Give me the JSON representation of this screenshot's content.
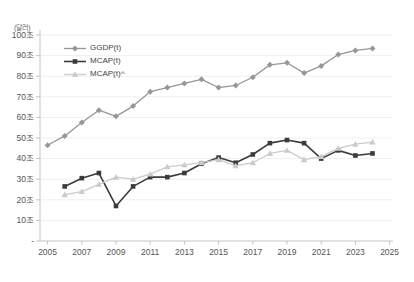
{
  "chart_data": {
    "type": "line",
    "title": "",
    "unit_label": "(달러)",
    "ylabel": "달러(조)",
    "grid": true,
    "legend_position": "inside-top-left",
    "x_axis": {
      "range": [
        2005,
        2025
      ],
      "tick_years": [
        2005,
        2007,
        2009,
        2011,
        2013,
        2015,
        2017,
        2019,
        2021,
        2023,
        2025
      ],
      "tick_labels": [
        "2005",
        "2007",
        "2009",
        "2011",
        "2013",
        "2015",
        "2017",
        "2019",
        "2021",
        "2023",
        "2025"
      ]
    },
    "y_axis": {
      "range": [
        0,
        100
      ],
      "tick_values": [
        0,
        10,
        20,
        30,
        40,
        50,
        60,
        70,
        80,
        90,
        100
      ],
      "tick_labels": [
        "-",
        "10조",
        "20조",
        "30조",
        "40조",
        "50조",
        "60조",
        "70조",
        "80조",
        "90조",
        "100조"
      ]
    },
    "years": [
      2005,
      2006,
      2007,
      2008,
      2009,
      2010,
      2011,
      2012,
      2013,
      2014,
      2015,
      2016,
      2017,
      2018,
      2019,
      2020,
      2021,
      2022,
      2023,
      2024
    ],
    "series": [
      {
        "name": "GGDP(t)",
        "marker": "diamond",
        "color": "#979797",
        "line_width": 1.3,
        "values": [
          46.5,
          51,
          57.5,
          63.5,
          60.5,
          65.5,
          72.5,
          74.5,
          76.5,
          78.5,
          74.5,
          75.5,
          79.5,
          85.5,
          86.5,
          81.5,
          85,
          90.5,
          92.5,
          93.5
        ]
      },
      {
        "name": "MCAP(t)",
        "marker": "square",
        "color": "#3b3b3b",
        "line_width": 1.6,
        "values": [
          null,
          26.5,
          30.5,
          33,
          17,
          26.5,
          31,
          31,
          33,
          37.5,
          40.5,
          38,
          42,
          47.5,
          49,
          47.5,
          40,
          44,
          41.5,
          42.5
        ]
      },
      {
        "name": "MCAP(t)^",
        "marker": "triangle",
        "color": "#cbcbcb",
        "line_width": 1.3,
        "values": [
          null,
          22.5,
          24,
          27.5,
          31,
          30,
          32.5,
          36,
          37,
          38,
          39.5,
          36.5,
          38,
          42.5,
          44,
          39.5,
          41,
          45,
          47,
          48
        ]
      }
    ],
    "colors": {
      "grid": "#f0f0f0",
      "axis": "#c4c4c4",
      "tick_text": "#555555"
    }
  }
}
